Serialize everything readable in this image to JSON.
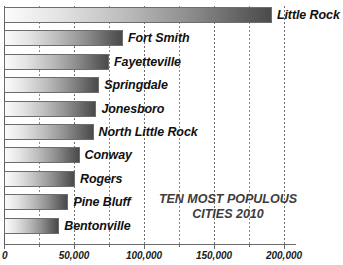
{
  "chart_data": {
    "type": "bar",
    "orientation": "horizontal",
    "title": "",
    "annotation_line1": "TEN MOST POPULOUS",
    "annotation_line2": "CITIES 2010",
    "xlabel": "",
    "ylabel": "",
    "xlim": [
      0,
      210000
    ],
    "grid": true,
    "grid_minor_step": 25000,
    "legend": "none",
    "tick_labels": [
      "0",
      "50,000",
      "100,000",
      "150,000",
      "200,000"
    ],
    "tick_values": [
      0,
      50000,
      100000,
      150000,
      200000
    ],
    "categories": [
      "Little Rock",
      "Fort Smith",
      "Fayetteville",
      "Springdale",
      "Jonesboro",
      "North Little Rock",
      "Conway",
      "Rogers",
      "Pine Bluff",
      "Bentonville"
    ],
    "values": [
      191400,
      85000,
      75000,
      68000,
      66000,
      64000,
      54000,
      50700,
      46000,
      39500
    ],
    "bar_gradient_start": "#fbfbfb",
    "bar_gradient_end": "#4a4a4a",
    "bar_border_color": "#6d6d6d",
    "gridline_color": "#8a8a8a",
    "axis_color": "#6a6a6a",
    "label_color": "#111111",
    "annotation_color": "#3d3d3d",
    "background": "#ffffff"
  }
}
